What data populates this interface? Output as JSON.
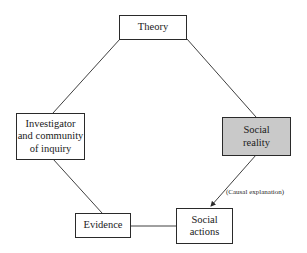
{
  "diagram": {
    "nodes": [
      {
        "id": "theory",
        "label": "Theory",
        "x": 119,
        "y": 15,
        "w": 68,
        "h": 25,
        "shaded": false
      },
      {
        "id": "investigator",
        "label": "Investigator and community of inquiry",
        "lines": [
          "Investigator",
          "and community",
          "of inquiry"
        ],
        "x": 16,
        "y": 113,
        "w": 69,
        "h": 47,
        "shaded": false
      },
      {
        "id": "social-reality",
        "label": "Social reality",
        "lines": [
          "Social",
          "reality"
        ],
        "x": 222,
        "y": 117,
        "w": 69,
        "h": 39,
        "shaded": true
      },
      {
        "id": "evidence",
        "label": "Evidence",
        "x": 75,
        "y": 213,
        "w": 56,
        "h": 25,
        "shaded": false
      },
      {
        "id": "social-actions",
        "label": "Social actions",
        "lines": [
          "Social",
          "actions"
        ],
        "x": 176,
        "y": 208,
        "w": 57,
        "h": 36,
        "shaded": false
      }
    ],
    "edges": [
      {
        "from": "theory",
        "to": "investigator",
        "arrow": false
      },
      {
        "from": "theory",
        "to": "social-reality",
        "arrow": false
      },
      {
        "from": "investigator",
        "to": "evidence",
        "arrow": false
      },
      {
        "from": "evidence",
        "to": "social-actions",
        "arrow": false
      },
      {
        "from": "social-reality",
        "to": "social-actions",
        "arrow": true,
        "label": "(Causal explanation)"
      }
    ],
    "colors": {
      "shaded_fill": "#c9c9c9",
      "stroke": "#2a2a2a",
      "background": "#ffffff"
    }
  }
}
